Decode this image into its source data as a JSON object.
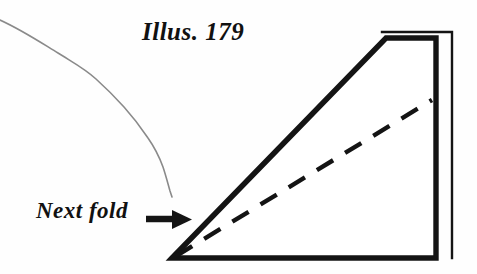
{
  "figure": {
    "caption": "Illus. 179",
    "annotation_label": "Next fold",
    "background_color": "#fefefe",
    "ink_color": "#111111",
    "guide_line_color": "#8a8a8a",
    "elements": {
      "caption_name": "illustration-caption",
      "annotation_name": "next-fold-annotation",
      "arrow_name": "next-fold-arrow-icon",
      "shape_name": "folded-paper-triangle",
      "dashed_name": "fold-crease-dashed-line",
      "guide_name": "hand-drawn-guide-line",
      "flap_name": "paper-back-flap-edge"
    }
  }
}
